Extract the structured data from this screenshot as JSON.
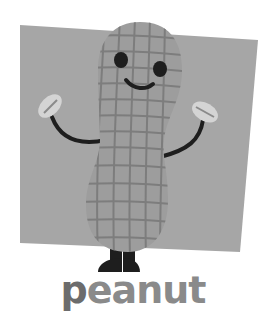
{
  "illustration": {
    "subject": "peanut character",
    "colors": {
      "background_panel": "#a6a6a6",
      "body": "#9d9d9d",
      "grid_lines": "#7d7d7d",
      "features": "#1e1e1e",
      "hands": "#d4d4d4"
    }
  },
  "caption": {
    "first_letter": "p",
    "rest": "eanut"
  }
}
